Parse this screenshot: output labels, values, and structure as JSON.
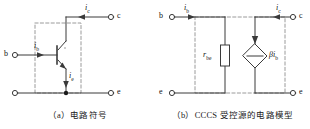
{
  "figure": {
    "background_color": "#ffffff",
    "line_color": "#3a3a3a",
    "dash_color": "#8a8a8a",
    "text_color": "#111111"
  },
  "panels": [
    {
      "id": "a",
      "caption": "（a）电路符号",
      "kind": "bjt-circuit-symbol",
      "device": "NPN bipolar junction transistor",
      "terminals": [
        {
          "name": "b",
          "label": "b",
          "position": "left"
        },
        {
          "name": "c",
          "label": "c",
          "position": "top-right"
        },
        {
          "name": "e",
          "label": "e",
          "position": "bottom-right"
        }
      ],
      "currents": [
        {
          "name": "i_b",
          "symbol": "i",
          "subscript": "b",
          "direction": "right"
        },
        {
          "name": "i_c",
          "symbol": "i",
          "subscript": "c",
          "direction": "left"
        },
        {
          "name": "i_e",
          "symbol": "i",
          "subscript": "e",
          "direction": "down"
        }
      ],
      "dashed_box": true
    },
    {
      "id": "b",
      "caption": "（b）CCCS 受控源的电路模型",
      "kind": "cccs-equivalent-circuit-model",
      "terminals": [
        {
          "name": "b",
          "label": "b",
          "position": "top-left"
        },
        {
          "name": "c",
          "label": "c",
          "position": "top-right"
        },
        {
          "name": "e-left",
          "label": "e",
          "position": "bottom-left"
        },
        {
          "name": "e-right",
          "label": "e",
          "position": "bottom-right"
        }
      ],
      "currents": [
        {
          "name": "i_b",
          "symbol": "i",
          "subscript": "b",
          "direction": "right"
        },
        {
          "name": "i_c",
          "symbol": "i",
          "subscript": "c",
          "direction": "left"
        }
      ],
      "components": [
        {
          "name": "resistor",
          "symbol": "r",
          "subscript": "be",
          "shape": "rectangle"
        },
        {
          "name": "dependent-current-source",
          "symbol": "βi",
          "subscript": "b",
          "shape": "diamond",
          "arrow_direction": "down"
        }
      ],
      "dashed_box": true
    }
  ]
}
